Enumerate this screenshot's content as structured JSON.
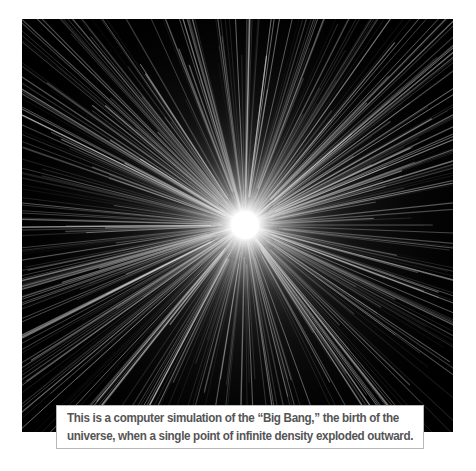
{
  "figure": {
    "background": "#000000",
    "burst_color": "#ffffff",
    "center": [
      223,
      206
    ]
  },
  "caption": {
    "line1": "This is a computer simulation of the “Big Bang,” the birth of the",
    "line2": "universe, when a single point of infinite density exploded outward."
  }
}
